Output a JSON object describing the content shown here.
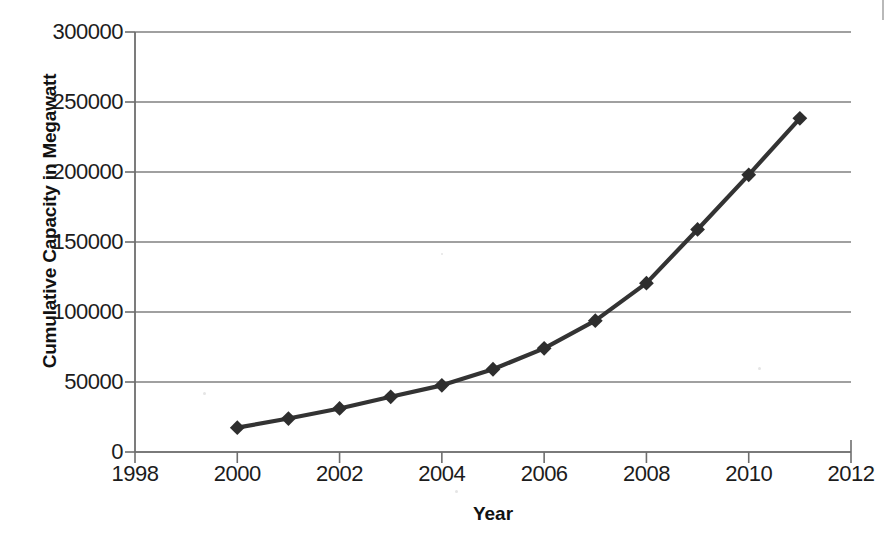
{
  "chart_data": {
    "type": "line",
    "title": "",
    "xlabel": "Year",
    "ylabel": "Cumulative Capacity in Megawatt",
    "x": [
      2000,
      2001,
      2002,
      2003,
      2004,
      2005,
      2006,
      2007,
      2008,
      2009,
      2010,
      2011
    ],
    "values": [
      17400,
      23900,
      31100,
      39431,
      47620,
      59091,
      74052,
      93820,
      120624,
      158975,
      197956,
      238351
    ],
    "series": [
      {
        "name": "Cumulative Capacity",
        "values": [
          17400,
          23900,
          31100,
          39431,
          47620,
          59091,
          74052,
          93820,
          120624,
          158975,
          197956,
          238351
        ]
      }
    ],
    "xlim": [
      1998,
      2012
    ],
    "ylim": [
      0,
      300000
    ],
    "xticks": [
      1998,
      2000,
      2002,
      2004,
      2006,
      2008,
      2010,
      2012
    ],
    "yticks": [
      0,
      50000,
      100000,
      150000,
      200000,
      250000,
      300000
    ],
    "xtick_labels": [
      "1998",
      "2000",
      "2002",
      "2004",
      "2006",
      "2008",
      "2010",
      "2012"
    ],
    "ytick_labels": [
      "0",
      "50000",
      "100000",
      "150000",
      "200000",
      "250000",
      "300000"
    ],
    "grid": "horizontal",
    "legend": "none",
    "marker": "diamond",
    "line_color": "#333333",
    "marker_color": "#2e2e2e",
    "grid_color": "#808080",
    "axis_color": "#6e6e6e",
    "background": "#ffffff"
  },
  "axes": {
    "y_title": "Cumulative Capacity in Megawatt",
    "x_title": "Year"
  }
}
